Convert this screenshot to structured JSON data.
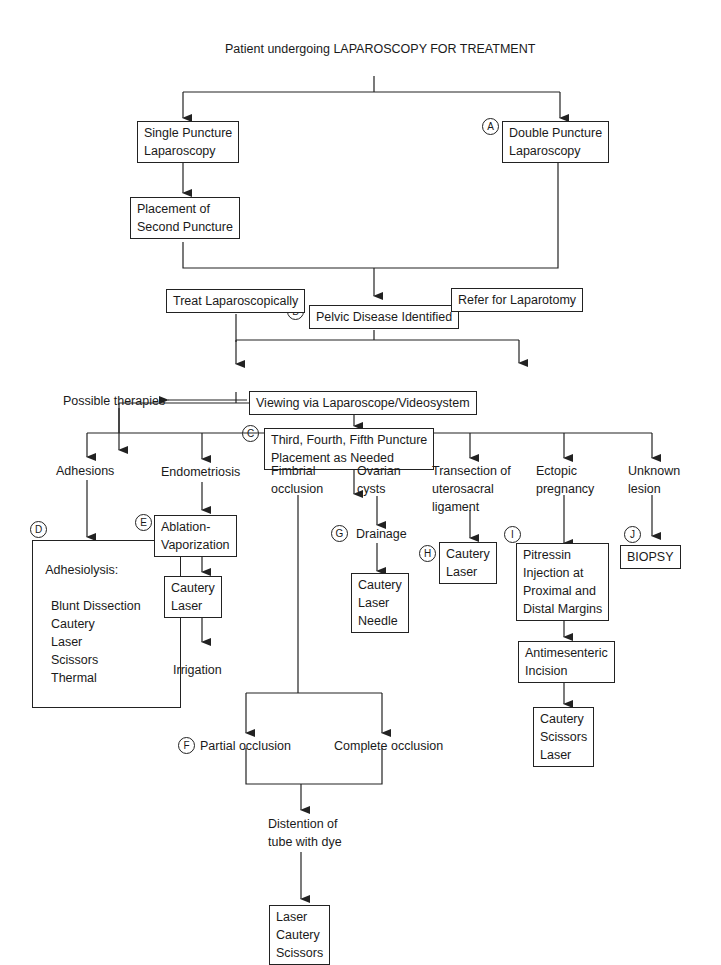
{
  "title": "Patient undergoing LAPAROSCOPY FOR TREATMENT",
  "nodes": {
    "single_puncture": "Single Puncture\nLaparoscopy",
    "double_puncture": "Double Puncture\nLaparoscopy",
    "second_puncture": "Placement of\nSecond Puncture",
    "pelvic_disease": "Pelvic Disease Identified",
    "treat_lap": "Treat Laparoscopically",
    "refer_laparotomy": "Refer for Laparotomy",
    "additional_puncture": "Third, Fourth, Fifth Puncture\nPlacement as Needed",
    "viewing": "Viewing via Laparoscope/Videosystem",
    "possible_therapies": "Possible therapies",
    "adhesions": "Adhesions",
    "adhesiolysis_title": "Adhesiolysis:",
    "adhesiolysis_items": "Blunt Dissection\nCautery\nLaser\nScissors\nThermal",
    "endometriosis": "Endometriosis",
    "ablation": "Ablation-\nVaporization",
    "endo_cautery": "Cautery\nLaser",
    "irrigation": "Irrigation",
    "fimbrial": "Fimbrial\nocclusion",
    "partial_occlusion": "Partial occlusion",
    "complete_occlusion": "Complete occlusion",
    "distention": "Distention of\ntube with dye",
    "fimbrial_tx": "Laser\nCautery\nScissors",
    "ovarian": "Ovarian\ncysts",
    "drainage": "Drainage",
    "ovarian_tx": "Cautery\nLaser\nNeedle",
    "transection": "Transection of\nuterosacral\nligament",
    "transection_tx": "Cautery\nLaser",
    "ectopic": "Ectopic\npregnancy",
    "pitressin": "Pitressin\nInjection at\nProximal and\nDistal Margins",
    "antimesenteric": "Antimesenteric\nIncision",
    "ectopic_tx": "Cautery\nScissors\nLaser",
    "unknown": "Unknown\nlesion",
    "biopsy": "BIOPSY"
  },
  "badges": {
    "a": "A",
    "b": "B",
    "c": "C",
    "d": "D",
    "e": "E",
    "f": "F",
    "g": "G",
    "h": "H",
    "i": "I",
    "j": "J"
  }
}
